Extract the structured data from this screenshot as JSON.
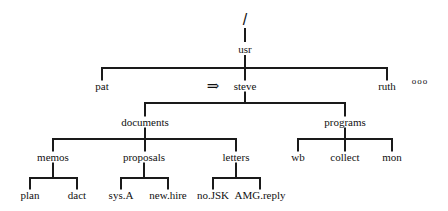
{
  "diagram": {
    "type": "directory-tree",
    "root": "/",
    "level1": "usr",
    "users": [
      "pat",
      "steve",
      "ruth"
    ],
    "more_indicator": "ooo",
    "current_marker": "⇒",
    "steve_children": [
      "documents",
      "programs"
    ],
    "documents_children": [
      "memos",
      "proposals",
      "letters"
    ],
    "programs_children": [
      "wb",
      "collect",
      "mon"
    ],
    "memos_children": [
      "plan",
      "dact"
    ],
    "proposals_children": [
      "sys.A",
      "new.hire"
    ],
    "letters_children": [
      "no.JSK",
      "AMG.reply"
    ]
  }
}
